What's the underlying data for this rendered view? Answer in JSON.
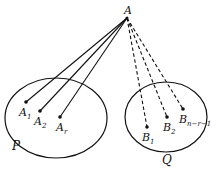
{
  "diagram": {
    "apex": {
      "label": "A",
      "x": 127,
      "y": 18
    },
    "sets": [
      {
        "name": "P",
        "cx": 56,
        "cy": 118,
        "rx": 51,
        "ry": 40,
        "label_x": 12,
        "label_y": 150
      },
      {
        "name": "Q",
        "cx": 166,
        "cy": 117,
        "rx": 41,
        "ry": 35,
        "label_x": 162,
        "label_y": 164
      }
    ],
    "points_P": [
      {
        "base": "A",
        "sub": "1",
        "x": 26,
        "y": 102,
        "lx": 19,
        "ly": 116
      },
      {
        "base": "A",
        "sub": "2",
        "x": 40,
        "y": 111,
        "lx": 34,
        "ly": 125
      },
      {
        "base": "A",
        "sub": "r",
        "x": 60,
        "y": 117,
        "lx": 56,
        "ly": 131
      }
    ],
    "points_Q": [
      {
        "base": "B",
        "sub": "1",
        "x": 147,
        "y": 127,
        "lx": 142,
        "ly": 141
      },
      {
        "base": "B",
        "sub": "2",
        "x": 167,
        "y": 117,
        "lx": 163,
        "ly": 131
      },
      {
        "base": "B",
        "sub": "n−r−1",
        "x": 183,
        "y": 109,
        "lx": 179,
        "ly": 123
      }
    ],
    "edge_styles": {
      "to_P": "solid",
      "to_Q": "dashed"
    }
  }
}
